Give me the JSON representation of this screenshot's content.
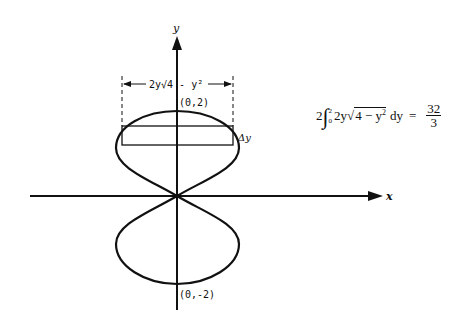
{
  "diagram": {
    "axes": {
      "x_label": "x",
      "y_label": "y"
    },
    "points": {
      "top": "(0,2)",
      "bottom": "(0,-2)"
    },
    "dimension_label": "2y√4 - y²",
    "strip_label": "Δy",
    "formula": {
      "coefficient": "2",
      "integral_sign": "∫",
      "upper_limit": "2",
      "lower_limit": "0",
      "integrand_prefix": "2y",
      "radical_symbol": "√",
      "radicand": "4 − y",
      "radicand_exp": "2",
      "differential": "dy",
      "equals": "=",
      "result_numerator": "32",
      "result_denominator": "3"
    },
    "colors": {
      "ink": "#111111",
      "background": "#ffffff"
    }
  }
}
